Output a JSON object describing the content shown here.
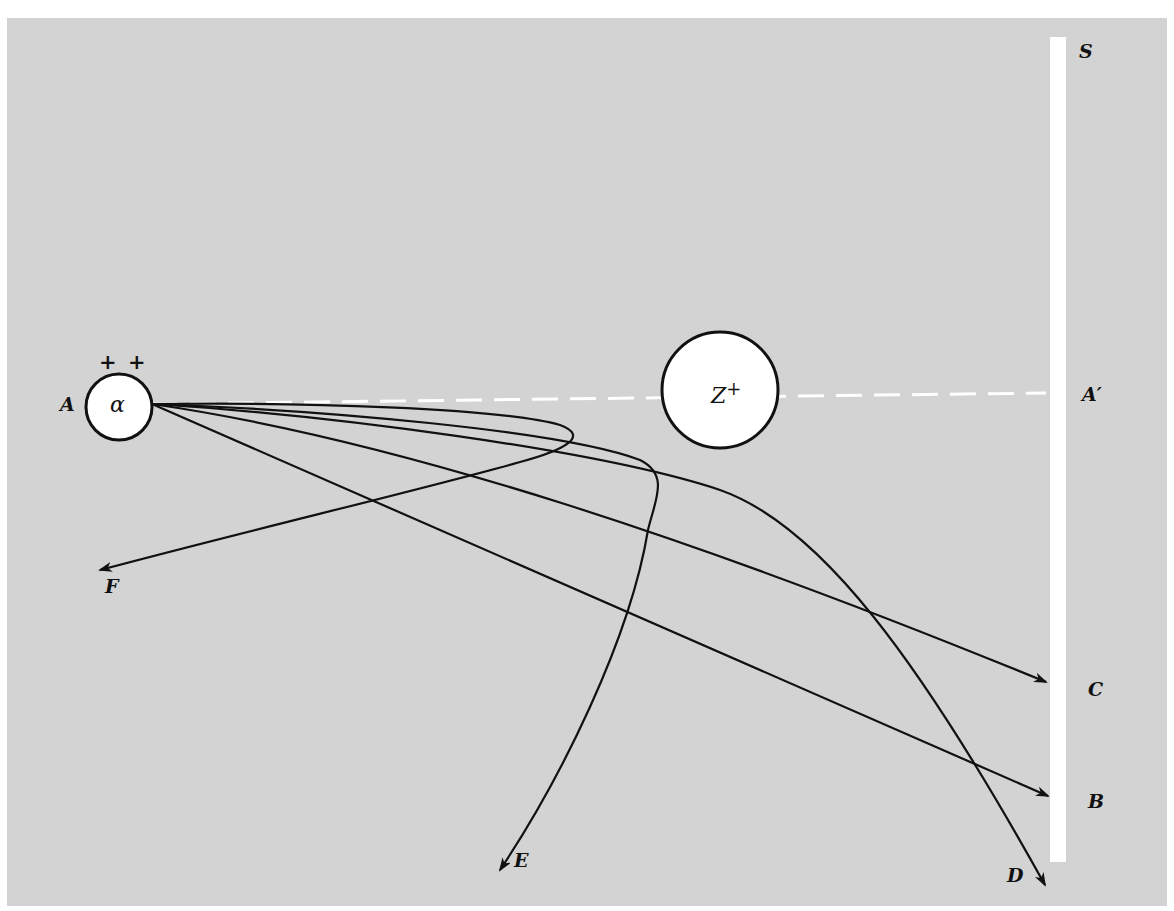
{
  "diagram": {
    "colors": {
      "background": "#d3d3d3",
      "paper": "#ffffff",
      "ink": "#111111",
      "screen": "#ffffff",
      "axis_dash": "#ffffff"
    },
    "alpha_particle": {
      "label": "α",
      "charge": "+ +",
      "source_label": "A",
      "center": [
        119,
        407
      ],
      "radius": 33
    },
    "nucleus": {
      "label": "Z",
      "charge_sup": "+",
      "center": [
        720,
        390
      ],
      "radius": 58
    },
    "screen": {
      "label": "S",
      "x": 1050,
      "y_top": 37,
      "y_bottom": 862,
      "width": 16
    },
    "axis": {
      "start_label": "A",
      "end_label": "A′",
      "style": "dashed",
      "y": 395
    },
    "trajectories": [
      {
        "label": "F",
        "description": "back-scattered, loops near origin side"
      },
      {
        "label": "E",
        "description": "large-angle deflection, curves sharply downward"
      },
      {
        "label": "D",
        "description": "curved deflection reaching lower edge of screen"
      },
      {
        "label": "C",
        "description": "slight deflection, hits screen"
      },
      {
        "label": "B",
        "description": "small deflection, straight path to screen"
      }
    ],
    "endpoint_labels": {
      "S": "S",
      "A_prime": "A′",
      "C": "C",
      "B": "B",
      "D": "D",
      "E": "E",
      "F": "F",
      "A": "A"
    }
  }
}
